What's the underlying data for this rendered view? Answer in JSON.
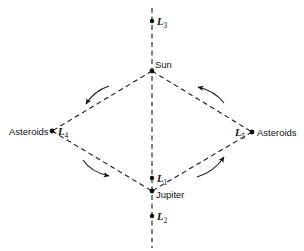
{
  "diagram": {
    "bodies": {
      "sun": {
        "label": "Sun"
      },
      "jupiter": {
        "label": "Jupiter"
      },
      "asteroids_left": {
        "label": "Asteroids"
      },
      "asteroids_right": {
        "label": "Asteroids"
      }
    },
    "lagrange_points": {
      "L1": {
        "letter": "L",
        "index": "1"
      },
      "L2": {
        "letter": "L",
        "index": "2"
      },
      "L3": {
        "letter": "L",
        "index": "3"
      },
      "L4": {
        "letter": "L",
        "index": "4"
      },
      "L5": {
        "letter": "L",
        "index": "5"
      }
    },
    "orbit_direction": "counterclockwise"
  }
}
